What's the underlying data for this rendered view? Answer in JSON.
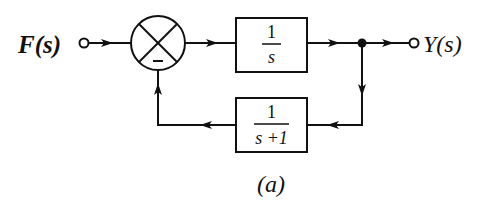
{
  "diagram": {
    "type": "block-diagram",
    "caption": "(a)",
    "input": {
      "label": "F(s)"
    },
    "output": {
      "label": "Y(s)"
    },
    "summing_junction": {
      "sign_bottom": "−"
    },
    "forward_block": {
      "numerator": "1",
      "denominator": "s"
    },
    "feedback_block": {
      "numerator": "1",
      "denominator": "s +1"
    },
    "colors": {
      "stroke": "#111111",
      "background": "#ffffff"
    }
  }
}
